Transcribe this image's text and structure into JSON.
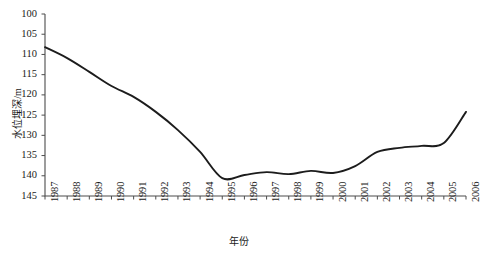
{
  "chart_data": {
    "type": "line",
    "title": "",
    "xlabel": "年份",
    "ylabel": "水位埋深/m",
    "x": [
      1987,
      1988,
      1989,
      1990,
      1991,
      1992,
      1993,
      1994,
      1995,
      1996,
      1997,
      1998,
      1999,
      2000,
      2001,
      2002,
      2003,
      2004,
      2005,
      2006
    ],
    "xtick_labels": [
      "1987",
      "1988",
      "1989",
      "1990",
      "1991",
      "1992",
      "1993",
      "1994",
      "1995",
      "1996",
      "1997",
      "1998",
      "1999",
      "2000",
      "2001",
      "2002",
      "2003",
      "2004",
      "2005",
      "2006"
    ],
    "values": [
      108.2,
      110.9,
      114.3,
      117.8,
      120.5,
      124.2,
      128.7,
      134.1,
      140.6,
      139.8,
      139.1,
      139.6,
      138.8,
      139.3,
      137.6,
      134.1,
      133.1,
      132.6,
      131.9,
      124.2
    ],
    "series": [
      {
        "name": "水位埋深",
        "values": [
          108.2,
          110.9,
          114.3,
          117.8,
          120.5,
          124.2,
          128.7,
          134.1,
          140.6,
          139.8,
          139.1,
          139.6,
          138.8,
          139.3,
          137.6,
          134.1,
          133.1,
          132.6,
          131.9,
          124.2
        ]
      }
    ],
    "ytick_labels": [
      "100",
      "105",
      "110",
      "115",
      "120",
      "125",
      "130",
      "135",
      "140",
      "145"
    ],
    "yticks": [
      100,
      105,
      110,
      115,
      120,
      125,
      130,
      135,
      140,
      145
    ],
    "ylim": [
      145,
      100
    ],
    "y_axis_inverted": true,
    "xlim": [
      1987,
      2006
    ],
    "grid": false,
    "legend": "none",
    "line_color": "#1c1c1c",
    "axis_color": "#4d4d4d"
  },
  "caption": "",
  "units": {
    "y": "m"
  }
}
